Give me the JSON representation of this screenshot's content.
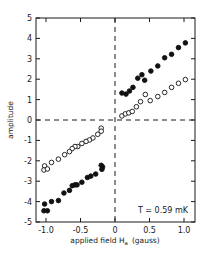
{
  "chart_data": {
    "type": "scatter",
    "title": "",
    "xlabel": "applied field H_a (gauss)",
    "xlabel_main": "applied field H",
    "xlabel_sub": "a",
    "xlabel_unit": "(gauss)",
    "ylabel": "amplitude",
    "xlim": [
      -1.15,
      1.15
    ],
    "ylim": [
      -5,
      5
    ],
    "x_ticks": [
      -1.0,
      -0.5,
      0,
      0.5,
      1.0
    ],
    "x_tick_labels": [
      "-1.0",
      "-0.5",
      "0",
      "0.5",
      "1.0"
    ],
    "y_ticks": [
      5,
      4,
      3,
      2,
      1,
      0,
      -1,
      -2,
      -3,
      -4,
      -5
    ],
    "y_tick_labels": [
      "5",
      "4",
      "3",
      "2",
      "1",
      "0",
      "-1",
      "-2",
      "-3",
      "-4",
      "-5"
    ],
    "grid": false,
    "reference_lines": {
      "x0_dashed": true,
      "y0_dashed": true
    },
    "annotation": "T = 0.59 mK",
    "series": [
      {
        "name": "filled",
        "marker": "filled-circle",
        "points": [
          [
            0.1,
            1.32
          ],
          [
            0.16,
            1.27
          ],
          [
            0.21,
            1.42
          ],
          [
            0.26,
            1.6
          ],
          [
            0.33,
            2.05
          ],
          [
            0.39,
            2.22
          ],
          [
            0.43,
            1.95
          ],
          [
            0.52,
            2.4
          ],
          [
            0.62,
            2.65
          ],
          [
            0.72,
            3.05
          ],
          [
            0.82,
            3.22
          ],
          [
            0.92,
            3.55
          ],
          [
            1.02,
            3.78
          ],
          [
            -0.2,
            -2.22
          ],
          [
            -0.18,
            -2.3
          ],
          [
            -0.19,
            -2.42
          ],
          [
            -0.28,
            -2.65
          ],
          [
            -0.35,
            -2.75
          ],
          [
            -0.4,
            -2.82
          ],
          [
            -0.48,
            -3.05
          ],
          [
            -0.55,
            -3.18
          ],
          [
            -0.58,
            -3.18
          ],
          [
            -0.62,
            -3.22
          ],
          [
            -0.66,
            -3.45
          ],
          [
            -0.74,
            -3.58
          ],
          [
            -0.82,
            -3.95
          ],
          [
            -0.92,
            -4.0
          ],
          [
            -1.02,
            -4.12
          ],
          [
            -1.03,
            -4.45
          ],
          [
            -0.98,
            -4.45
          ]
        ]
      },
      {
        "name": "open",
        "marker": "open-circle",
        "points": [
          [
            0.1,
            0.2
          ],
          [
            0.15,
            0.3
          ],
          [
            0.2,
            0.35
          ],
          [
            0.25,
            0.42
          ],
          [
            0.31,
            0.65
          ],
          [
            0.37,
            0.9
          ],
          [
            0.44,
            1.25
          ],
          [
            0.51,
            0.95
          ],
          [
            0.62,
            1.15
          ],
          [
            0.72,
            1.35
          ],
          [
            0.82,
            1.6
          ],
          [
            0.92,
            1.8
          ],
          [
            1.02,
            1.98
          ],
          [
            -0.2,
            -0.4
          ],
          [
            -0.2,
            -0.55
          ],
          [
            -0.25,
            -0.7
          ],
          [
            -0.32,
            -0.88
          ],
          [
            -0.37,
            -0.98
          ],
          [
            -0.42,
            -1.05
          ],
          [
            -0.48,
            -1.15
          ],
          [
            -0.54,
            -1.3
          ],
          [
            -0.58,
            -1.3
          ],
          [
            -0.62,
            -1.4
          ],
          [
            -0.66,
            -1.55
          ],
          [
            -0.73,
            -1.7
          ],
          [
            -0.82,
            -1.92
          ],
          [
            -0.92,
            -2.08
          ],
          [
            -1.02,
            -2.25
          ],
          [
            -1.03,
            -2.45
          ],
          [
            -0.98,
            -2.4
          ]
        ]
      }
    ]
  },
  "plot": {
    "annotation": "T = 0.59 mK",
    "ylabel": "amplitude",
    "xlabel_main": "applied field H",
    "xlabel_sub": "a",
    "xlabel_unit": "(gauss)"
  }
}
